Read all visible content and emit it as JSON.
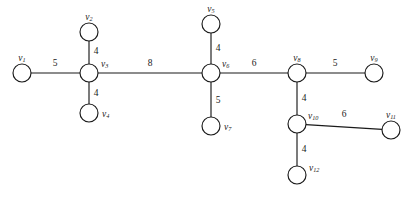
{
  "diagram": {
    "type": "weighted-undirected-graph",
    "background_color": "#ffffff",
    "stroke_color": "#1a1a1a",
    "node_radius": 9,
    "nodes": [
      {
        "id": "v1",
        "base": "v",
        "sub": "1",
        "cx": 22,
        "cy": 73,
        "label_dx": 0,
        "label_dy": -14,
        "label_anchor": "middle"
      },
      {
        "id": "v2",
        "base": "v",
        "sub": "2",
        "cx": 89,
        "cy": 32,
        "label_dx": 0,
        "label_dy": -14,
        "label_anchor": "middle"
      },
      {
        "id": "v3",
        "base": "v",
        "sub": "3",
        "cx": 89,
        "cy": 73,
        "label_dx": 12,
        "label_dy": -8,
        "label_anchor": "start"
      },
      {
        "id": "v4",
        "base": "v",
        "sub": "4",
        "cx": 89,
        "cy": 113,
        "label_dx": 13,
        "label_dy": 2,
        "label_anchor": "start"
      },
      {
        "id": "v5",
        "base": "v",
        "sub": "5",
        "cx": 211,
        "cy": 24,
        "label_dx": 0,
        "label_dy": -14,
        "label_anchor": "middle"
      },
      {
        "id": "v6",
        "base": "v",
        "sub": "6",
        "cx": 211,
        "cy": 73,
        "label_dx": 11,
        "label_dy": -8,
        "label_anchor": "start"
      },
      {
        "id": "v7",
        "base": "v",
        "sub": "7",
        "cx": 211,
        "cy": 126,
        "label_dx": 13,
        "label_dy": 2,
        "label_anchor": "start"
      },
      {
        "id": "v8",
        "base": "v",
        "sub": "8",
        "cx": 297,
        "cy": 73,
        "label_dx": 0,
        "label_dy": -14,
        "label_anchor": "middle"
      },
      {
        "id": "v9",
        "base": "v",
        "sub": "9",
        "cx": 374,
        "cy": 73,
        "label_dx": 0,
        "label_dy": -14,
        "label_anchor": "middle"
      },
      {
        "id": "v10",
        "base": "v",
        "sub": "10",
        "cx": 297,
        "cy": 124,
        "label_dx": 11,
        "label_dy": -7,
        "label_anchor": "start"
      },
      {
        "id": "v11",
        "base": "v",
        "sub": "11",
        "cx": 391,
        "cy": 130,
        "label_dx": 0,
        "label_dy": -14,
        "label_anchor": "middle"
      },
      {
        "id": "v12",
        "base": "v",
        "sub": "12",
        "cx": 297,
        "cy": 175,
        "label_dx": 12,
        "label_dy": -6,
        "label_anchor": "start"
      }
    ],
    "edges": [
      {
        "id": "e-v1-v3",
        "from": "v1",
        "to": "v3",
        "weight": "5",
        "wx": 55,
        "wy": 64
      },
      {
        "id": "e-v2-v3",
        "from": "v2",
        "to": "v3",
        "weight": "4",
        "wx": 96,
        "wy": 52
      },
      {
        "id": "e-v3-v4",
        "from": "v3",
        "to": "v4",
        "weight": "4",
        "wx": 96,
        "wy": 94
      },
      {
        "id": "e-v3-v6",
        "from": "v3",
        "to": "v6",
        "weight": "8",
        "wx": 150,
        "wy": 64
      },
      {
        "id": "e-v5-v6",
        "from": "v5",
        "to": "v6",
        "weight": "4",
        "wx": 218,
        "wy": 49
      },
      {
        "id": "e-v6-v7",
        "from": "v6",
        "to": "v7",
        "weight": "5",
        "wx": 218,
        "wy": 101
      },
      {
        "id": "e-v6-v8",
        "from": "v6",
        "to": "v8",
        "weight": "6",
        "wx": 254,
        "wy": 64
      },
      {
        "id": "e-v8-v9",
        "from": "v8",
        "to": "v9",
        "weight": "5",
        "wx": 335,
        "wy": 64
      },
      {
        "id": "e-v8-v10",
        "from": "v8",
        "to": "v10",
        "weight": "4",
        "wx": 304,
        "wy": 99
      },
      {
        "id": "e-v10-v11",
        "from": "v10",
        "to": "v11",
        "weight": "6",
        "wx": 344,
        "wy": 115
      },
      {
        "id": "e-v10-v12",
        "from": "v10",
        "to": "v12",
        "weight": "4",
        "wx": 304,
        "wy": 150
      }
    ]
  }
}
